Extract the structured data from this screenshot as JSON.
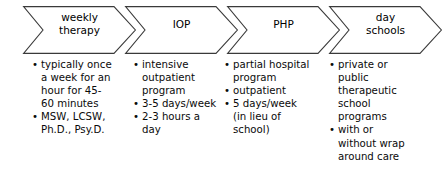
{
  "diagram": {
    "stroke_color": "#3a3a3a",
    "text_color": "#0a0a0a",
    "background_color": "#ffffff",
    "stages": [
      {
        "id": "weekly-therapy",
        "heading_lines": [
          "weekly",
          "therapy"
        ],
        "heading_text": "weekly therapy",
        "bullets": [
          "typically once a week for an hour for 45-60 minutes",
          "MSW, LCSW, Ph.D., Psy.D."
        ]
      },
      {
        "id": "iop",
        "heading_lines": [
          "IOP"
        ],
        "heading_text": "IOP",
        "bullets": [
          "intensive outpatient program",
          "3-5 days/week",
          "2-3 hours a day"
        ]
      },
      {
        "id": "php",
        "heading_lines": [
          "PHP"
        ],
        "heading_text": "PHP",
        "bullets": [
          "partial hospital program",
          "outpatient",
          "5 days/week (in lieu of school)"
        ]
      },
      {
        "id": "day-schools",
        "heading_lines": [
          "day",
          "schools"
        ],
        "heading_text": "day schools",
        "bullets": [
          "private or public therapeutic school programs",
          "with or without wrap around care"
        ]
      }
    ]
  }
}
